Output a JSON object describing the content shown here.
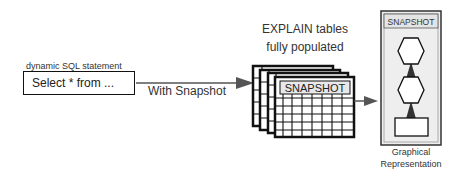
{
  "input": {
    "label": "dynamic SQL statement",
    "statement": "Select * from ..."
  },
  "connector": {
    "label": "With Snapshot"
  },
  "explain_tables": {
    "caption_line1": "EXPLAIN tables",
    "caption_line2": "fully populated",
    "front_table_title": "SNAPSHOT",
    "stack_count": 4
  },
  "output_panel": {
    "title": "SNAPSHOT",
    "caption_line1": "Graphical",
    "caption_line2": "Representation",
    "nodes": [
      "hexagon",
      "hexagon",
      "rectangle"
    ]
  },
  "colors": {
    "stroke": "#111111",
    "arrow": "#444444",
    "panel_fill": "#eeeeee",
    "header_fill": "#e4e4e4"
  }
}
